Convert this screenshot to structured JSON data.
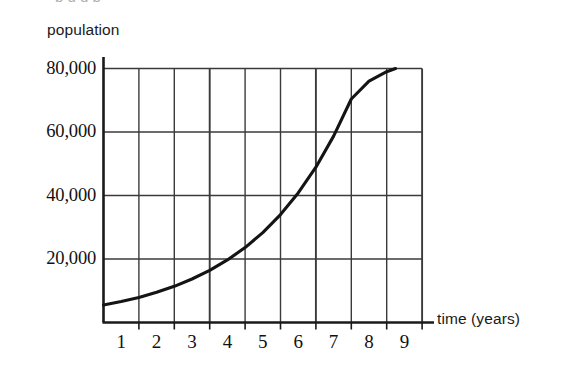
{
  "figure": {
    "background_color": "#ffffff",
    "ink_color": "#1a1a1a",
    "grid_color": "#3a3a3a",
    "top_cropped_text": "p                      g   g  p"
  },
  "chart_data": {
    "type": "line",
    "title": "",
    "subtitle": "",
    "xlabel": "time (years)",
    "ylabel": "population",
    "xlim": [
      0,
      9.3
    ],
    "ylim": [
      0,
      80000
    ],
    "grid": true,
    "legend": null,
    "x_tick_labels": [
      "1",
      "2",
      "3",
      "4",
      "5",
      "6",
      "7",
      "8",
      "9"
    ],
    "x_tick_values": [
      1,
      2,
      3,
      4,
      5,
      6,
      7,
      8,
      9
    ],
    "y_tick_labels": [
      "20,000",
      "40,000",
      "60,000",
      "80,000"
    ],
    "y_tick_values": [
      20000,
      40000,
      60000,
      80000
    ],
    "annotations": [],
    "series": [
      {
        "name": "population",
        "description": "exponential growth curve",
        "x": [
          0,
          0.5,
          1,
          1.5,
          2,
          2.5,
          3,
          3.5,
          4,
          4.5,
          5,
          5.5,
          6,
          6.5,
          7,
          7.5,
          8,
          8.25
        ],
        "y": [
          5500,
          6600,
          7900,
          9500,
          11400,
          13700,
          16400,
          19700,
          23600,
          28300,
          34000,
          40800,
          48900,
          58700,
          70400,
          76000,
          79000,
          80000
        ]
      }
    ]
  },
  "labels": {
    "y_axis_title": "population",
    "x_axis_title": "time (years)"
  }
}
